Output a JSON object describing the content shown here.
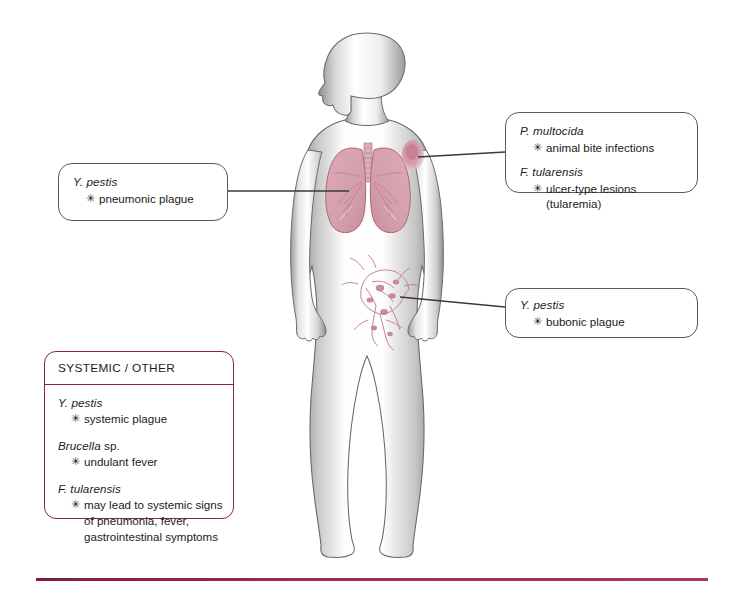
{
  "diagram": {
    "bullet_glyph": "✳",
    "colors": {
      "box_border": "#58595b",
      "systemic_border": "#8d2340",
      "rule": "#8d2340",
      "lung_fill": "#d9a4ae",
      "lung_outline": "#b0657a",
      "lesion": "#cf8b9c",
      "lymph": "#c4808f",
      "body_outline": "#5a5a5a"
    }
  },
  "callouts": {
    "lungs": {
      "name": "pneumonic-plague-callout",
      "entries": [
        {
          "organism_italic": "Y. pestis",
          "organism_roman": "",
          "items": [
            "pneumonic plague"
          ]
        }
      ]
    },
    "skin": {
      "name": "skin-lesion-callout",
      "entries": [
        {
          "organism_italic": "P. multocida",
          "organism_roman": "",
          "items": [
            "animal bite infections"
          ]
        },
        {
          "organism_italic": "F. tularensis",
          "organism_roman": "",
          "items": [
            "ulcer-type lesions (tularemia)"
          ]
        }
      ]
    },
    "lymph": {
      "name": "bubonic-plague-callout",
      "entries": [
        {
          "organism_italic": "Y. pestis",
          "organism_roman": "",
          "items": [
            "bubonic plague"
          ]
        }
      ]
    },
    "systemic": {
      "name": "systemic-other-callout",
      "header": "SYSTEMIC / OTHER",
      "entries": [
        {
          "organism_italic": "Y. pestis",
          "organism_roman": "",
          "items": [
            "systemic plague"
          ]
        },
        {
          "organism_italic": "Brucella",
          "organism_roman": " sp.",
          "items": [
            "undulant fever"
          ]
        },
        {
          "organism_italic": "F. tularensis",
          "organism_roman": "",
          "items": [
            "may lead to systemic signs of pneumonia, fever, gastrointestinal symptoms"
          ]
        }
      ]
    }
  }
}
